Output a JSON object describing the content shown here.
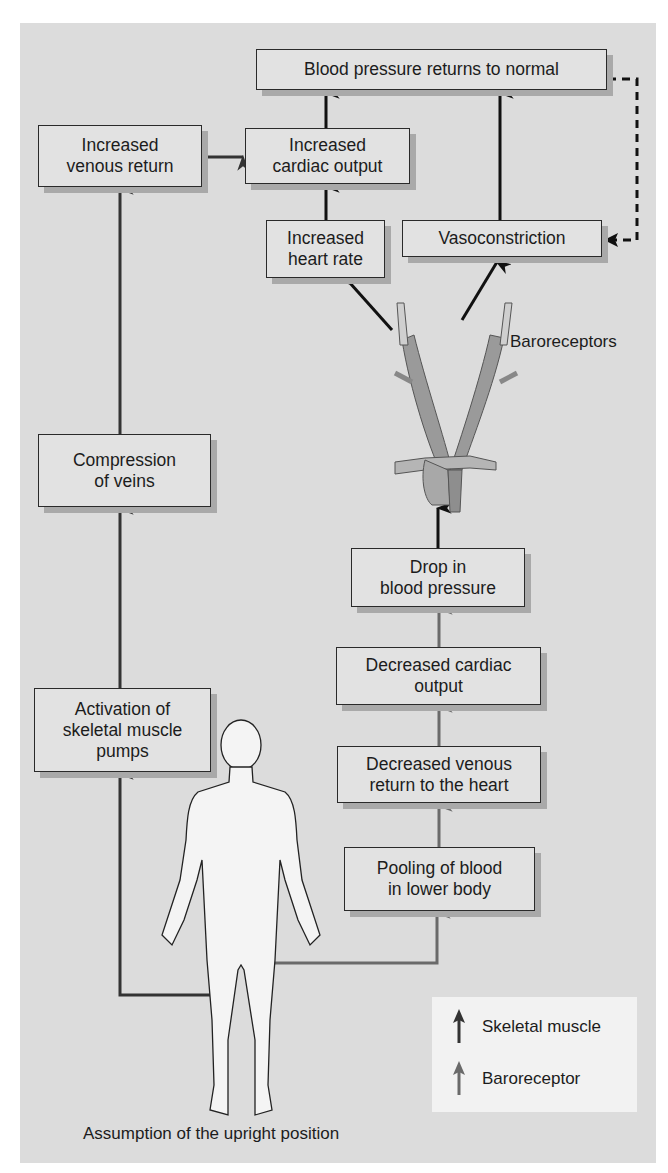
{
  "boxes": {
    "bp_normal": "Blood pressure returns to normal",
    "increased_venous_return": "Increased\nvenous return",
    "increased_cardiac_output": "Increased\ncardiac output",
    "increased_heart_rate": "Increased\nheart rate",
    "vasoconstriction": "Vasoconstriction",
    "compression_of_veins": "Compression\nof veins",
    "activation_muscle_pumps": "Activation of\nskeletal muscle\npumps",
    "drop_bp": "Drop in\nblood pressure",
    "decreased_cardiac_output": "Decreased cardiac\noutput",
    "decreased_venous_return": "Decreased venous\nreturn to the heart",
    "pooling_blood": "Pooling of blood\nin lower body"
  },
  "labels": {
    "baroreceptors": "Baroreceptors",
    "caption": "Assumption of the upright position"
  },
  "legend": {
    "skeletal_muscle": "Skeletal muscle",
    "baroreceptor": "Baroreceptor"
  },
  "colors": {
    "panel": "#dcdcdc",
    "skeletal_arrow": "#333333",
    "baroreceptor_arrow": "#6a6a6a"
  }
}
